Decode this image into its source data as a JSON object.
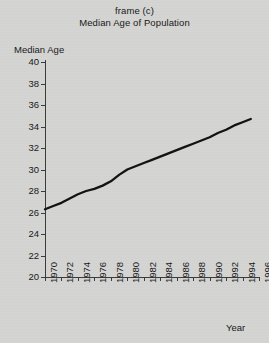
{
  "figure": {
    "frame_label": "frame (c)",
    "title": "Median Age of Population",
    "ylabel": "Median Age",
    "xlabel": "Year",
    "background_color": "#d4d4d2",
    "line_color": "#111111",
    "axis_color": "#3a3a3a"
  },
  "chart_data": {
    "type": "line",
    "title": "Median Age of Population",
    "subtitle": "frame (c)",
    "xlabel": "Year",
    "ylabel": "Median Age",
    "xlim": [
      1970,
      1996
    ],
    "ylim": [
      20,
      40
    ],
    "ytick_step": 2,
    "xtick_step": 2,
    "grid": false,
    "legend": false,
    "xticks": [
      1970,
      1972,
      1974,
      1976,
      1978,
      1980,
      1982,
      1984,
      1986,
      1988,
      1990,
      1992,
      1994,
      1996
    ],
    "yticks": [
      20,
      22,
      24,
      26,
      28,
      30,
      32,
      34,
      36,
      38,
      40
    ],
    "series": [
      {
        "name": "Median Age",
        "x": [
          1970,
          1971,
          1972,
          1973,
          1974,
          1975,
          1976,
          1977,
          1978,
          1979,
          1980,
          1981,
          1982,
          1983,
          1984,
          1985,
          1986,
          1987,
          1988,
          1989,
          1990,
          1991,
          1992,
          1993,
          1994,
          1995
        ],
        "values": [
          26.3,
          26.6,
          26.9,
          27.3,
          27.7,
          28.0,
          28.2,
          28.5,
          28.9,
          29.5,
          30.0,
          30.3,
          30.6,
          30.9,
          31.2,
          31.5,
          31.8,
          32.1,
          32.4,
          32.7,
          33.0,
          33.4,
          33.7,
          34.1,
          34.4,
          34.7
        ]
      }
    ]
  }
}
